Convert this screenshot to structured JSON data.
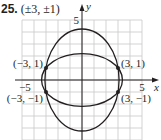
{
  "problem": {
    "number": "25.",
    "answer": "(±3, ±1)"
  },
  "chart_data": {
    "type": "line",
    "title": "25. (±3, ±1)",
    "xlabel": "x",
    "ylabel": "y",
    "xlim": [
      -5.5,
      6
    ],
    "ylim": [
      -5,
      5
    ],
    "grid": true,
    "x_tick_labels": [
      {
        "value": -5,
        "label": "−5"
      },
      {
        "value": 5,
        "label": "5"
      }
    ],
    "y_tick_labels": [
      {
        "value": 5,
        "label": "5"
      },
      {
        "value": -5,
        "label": "−5"
      }
    ],
    "series": [
      {
        "name": "tall ellipse",
        "shape": "ellipse",
        "center": [
          0,
          0
        ],
        "semi_x": 3.09,
        "semi_y": 4.25
      },
      {
        "name": "wide ellipse",
        "shape": "ellipse",
        "center": [
          0,
          0
        ],
        "semi_x": 3.37,
        "semi_y": 2.2
      }
    ],
    "points": [
      {
        "x": -3,
        "y": 1,
        "label": "(−3, 1)"
      },
      {
        "x": 3,
        "y": 1,
        "label": "(3, 1)"
      },
      {
        "x": -3,
        "y": -1,
        "label": "(−3, −1)"
      },
      {
        "x": 3,
        "y": -1,
        "label": "(3, −1)"
      }
    ],
    "legend": null
  }
}
